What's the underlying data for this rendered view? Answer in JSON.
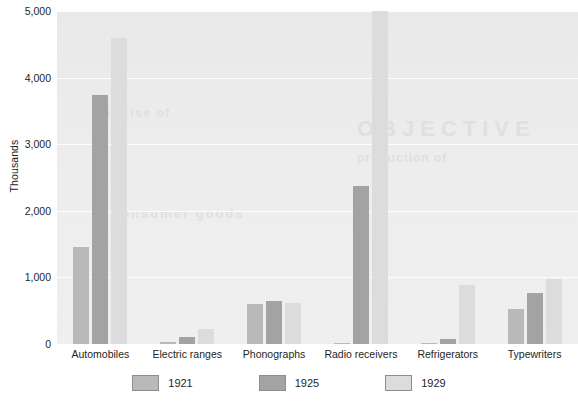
{
  "chart_data": {
    "type": "bar",
    "title": "",
    "xlabel": "",
    "ylabel": "Thousands",
    "ylim": [
      0,
      5000
    ],
    "ytick_labels": [
      "0",
      "1,000",
      "2,000",
      "3,000",
      "4,000",
      "5,000"
    ],
    "ytick_values": [
      0,
      1000,
      2000,
      3000,
      4000,
      5000
    ],
    "grid": true,
    "legend_position": "bottom",
    "categories": [
      "Automobiles",
      "Electric ranges",
      "Phonographs",
      "Radio receivers",
      "Refrigerators",
      "Typewriters"
    ],
    "series": [
      {
        "name": "1921",
        "color": "#b9b9b9",
        "values": [
          1450,
          30,
          600,
          10,
          5,
          520
        ]
      },
      {
        "name": "1925",
        "color": "#a3a3a3",
        "values": [
          3735,
          100,
          643,
          2372,
          75,
          760
        ]
      },
      {
        "name": "1929",
        "color": "#dcdcdc",
        "values": [
          4595,
          230,
          610,
          5000,
          890,
          975
        ]
      }
    ]
  },
  "legend": {
    "items": [
      {
        "label": "1921",
        "color": "#b9b9b9"
      },
      {
        "label": "1925",
        "color": "#a3a3a3"
      },
      {
        "label": "1929",
        "color": "#dcdcdc"
      }
    ]
  },
  "background_text": {
    "a": "OBJECTIVE",
    "b": "consumer goods",
    "c": "the rise of",
    "d": "production of"
  }
}
